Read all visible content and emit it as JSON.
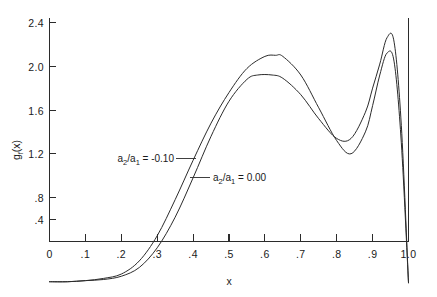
{
  "chart_data": {
    "type": "line",
    "title": "",
    "xlabel": "x",
    "ylabel": "g_f(x)",
    "xlim": [
      0,
      1.0
    ],
    "ylim": [
      0,
      2.6
    ],
    "grid": false,
    "legend_position": "inline-annotations",
    "xticks": [
      0,
      0.1,
      0.2,
      0.3,
      0.4,
      0.5,
      0.6,
      0.7,
      0.8,
      0.9,
      1.0
    ],
    "xtick_labels": [
      "0",
      ".1",
      ".2",
      ".3",
      ".4",
      ".5",
      ".6",
      ".7",
      ".8",
      ".9",
      "1.0"
    ],
    "yticks": [
      0.4,
      0.8,
      1.2,
      1.6,
      2.0,
      2.4
    ],
    "ytick_labels": [
      ".4",
      ".8",
      "1.2",
      "1.6",
      "2.0",
      "2.4"
    ],
    "series": [
      {
        "name": "a2/a1 = -0.10",
        "label_main": "a",
        "label_sub1": "2",
        "label_slash": "/a",
        "label_sub2": "1",
        "label_value": "= -0.10",
        "x": [
          0.0,
          0.05,
          0.1,
          0.15,
          0.2,
          0.25,
          0.3,
          0.35,
          0.4,
          0.45,
          0.5,
          0.55,
          0.6,
          0.63,
          0.65,
          0.7,
          0.75,
          0.8,
          0.84,
          0.88,
          0.9,
          0.92,
          0.94,
          0.96,
          0.98,
          1.0
        ],
        "y": [
          0.03,
          0.03,
          0.04,
          0.06,
          0.1,
          0.22,
          0.45,
          0.78,
          1.14,
          1.48,
          1.76,
          1.98,
          2.09,
          2.1,
          2.09,
          1.92,
          1.62,
          1.32,
          1.2,
          1.4,
          1.64,
          1.92,
          2.12,
          2.04,
          1.3,
          0.02
        ]
      },
      {
        "name": "a2/a1 = 0.00",
        "label_main": "a",
        "label_sub1": "2",
        "label_slash": "/a",
        "label_sub2": "1",
        "label_value": "= 0.00",
        "x": [
          0.0,
          0.05,
          0.1,
          0.15,
          0.2,
          0.25,
          0.3,
          0.35,
          0.4,
          0.45,
          0.5,
          0.55,
          0.58,
          0.62,
          0.65,
          0.7,
          0.75,
          0.8,
          0.84,
          0.88,
          0.9,
          0.92,
          0.94,
          0.96,
          0.98,
          1.0
        ],
        "y": [
          0.03,
          0.03,
          0.04,
          0.05,
          0.08,
          0.16,
          0.34,
          0.62,
          0.98,
          1.36,
          1.68,
          1.88,
          1.92,
          1.92,
          1.89,
          1.74,
          1.52,
          1.34,
          1.34,
          1.58,
          1.8,
          2.02,
          2.26,
          2.22,
          1.46,
          0.02
        ]
      }
    ],
    "annotations": [
      {
        "id": "annotation-upper",
        "text": "a2/a1 = -0.10",
        "leader": true
      },
      {
        "id": "annotation-lower",
        "text": "a2/a1 = 0.00",
        "leader": true
      }
    ]
  }
}
